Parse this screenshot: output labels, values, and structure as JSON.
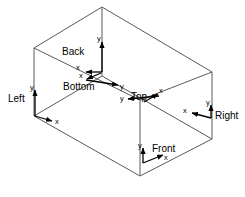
{
  "figure": {
    "type": "wireframe-cuboid-with-axis-triads",
    "background_color": "#ffffff",
    "line_color": "#5a5a5a",
    "axis_color": "#000000",
    "text_color": "#000000"
  },
  "box": {
    "name": "cuboid",
    "vertices": {
      "top_back_peak": [
        102,
        7
      ],
      "top_left": [
        34,
        48
      ],
      "top_right": [
        212,
        72
      ],
      "top_front": [
        140,
        100
      ],
      "bottom_left": [
        34,
        116
      ],
      "bottom_right": [
        212,
        139
      ],
      "bottom_front": [
        140,
        176
      ]
    }
  },
  "faces": [
    {
      "id": "back",
      "label": "Back",
      "label_pos": [
        62,
        52
      ],
      "origin": [
        102,
        72
      ],
      "x_axis": {
        "letter": "x",
        "direction": "left",
        "tip": [
          83,
          72
        ],
        "letter_pos": [
          78,
          68
        ]
      },
      "y_axis": {
        "letter": "y",
        "direction": "up",
        "tip": [
          102,
          40
        ],
        "letter_pos": [
          99,
          39
        ]
      }
    },
    {
      "id": "bottom",
      "label": "Bottom",
      "label_pos": [
        64,
        84
      ],
      "origin": [
        84,
        80
      ],
      "x_axis": {
        "letter": "x",
        "direction": "up-left",
        "tip": [
          84,
          80
        ],
        "letter_pos": [
          80,
          78
        ]
      },
      "y_axis": {
        "letter": "y",
        "direction": "down-right",
        "tip": [
          122,
          84
        ],
        "letter_pos": [
          121,
          88
        ]
      }
    },
    {
      "id": "top",
      "label": "Top",
      "label_pos": [
        133,
        92
      ],
      "origin": [
        159,
        96
      ],
      "x_axis": {
        "letter": "x",
        "direction": "up-right",
        "tip": [
          159,
          96
        ],
        "letter_pos": [
          158,
          92
        ]
      },
      "y_axis": {
        "letter": "y",
        "direction": "left",
        "tip": [
          125,
          99
        ],
        "letter_pos": [
          120,
          99
        ]
      }
    },
    {
      "id": "left",
      "label": "Left",
      "label_pos": [
        9,
        98
      ],
      "origin": [
        35,
        116
      ],
      "x_axis": {
        "letter": "x",
        "direction": "down-right",
        "tip": [
          54,
          122
        ],
        "letter_pos": [
          56,
          122
        ]
      },
      "y_axis": {
        "letter": "y",
        "direction": "up",
        "tip": [
          35,
          88
        ],
        "letter_pos": [
          32,
          87
        ]
      }
    },
    {
      "id": "right",
      "label": "Right",
      "label_pos": [
        215,
        114
      ],
      "origin": [
        211,
        118
      ],
      "x_axis": {
        "letter": "x",
        "direction": "down-left",
        "tip": [
          190,
          113
        ],
        "letter_pos": [
          185,
          112
        ]
      },
      "y_axis": {
        "letter": "y",
        "direction": "up",
        "tip": [
          211,
          103
        ],
        "letter_pos": [
          208,
          104
        ]
      }
    },
    {
      "id": "front",
      "label": "Front",
      "label_pos": [
        154,
        148
      ],
      "origin": [
        143,
        163
      ],
      "x_axis": {
        "letter": "x",
        "direction": "up-right",
        "tip": [
          165,
          155
        ],
        "letter_pos": [
          166,
          158
        ]
      },
      "y_axis": {
        "letter": "y",
        "direction": "up",
        "tip": [
          143,
          146
        ],
        "letter_pos": [
          140,
          146
        ]
      }
    }
  ],
  "axis_letters": {
    "x": "x",
    "y": "y"
  }
}
